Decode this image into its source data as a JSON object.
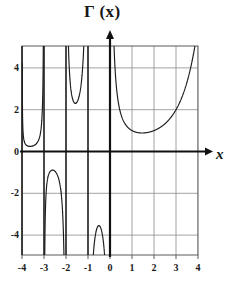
{
  "figure": {
    "kind": "function-plot",
    "background_color": "#ffffff",
    "y_axis_title": "Γ (x)",
    "x_axis_title": "x"
  },
  "chart_data": {
    "type": "line",
    "title": "Γ (x)",
    "function": "gamma",
    "xlabel": "x",
    "ylabel": "Γ (x)",
    "xlim": [
      -4,
      4
    ],
    "ylim": [
      -5,
      5
    ],
    "grid": true,
    "grid_color": "#8c8c8c",
    "curve_color": "#1a1a1a",
    "axis_color": "#111111",
    "frame_color": "#5a5a5a",
    "legend": "none",
    "x_ticks": [
      -4,
      -3,
      -2,
      -1,
      0,
      1,
      2,
      3,
      4
    ],
    "x_tick_labels": [
      "-4",
      "-3",
      "-2",
      "-1",
      "0",
      "1",
      "2",
      "3",
      "4"
    ],
    "y_ticks": [
      4,
      2,
      0,
      -2,
      -4
    ],
    "y_tick_labels": [
      "4",
      "2",
      "0",
      "-2",
      "-4"
    ],
    "poles": [
      -4,
      -3,
      -2,
      -1,
      0
    ],
    "branches": [
      {
        "name": "branch--4--3",
        "x_start": -3.99,
        "x_end": -3.01,
        "sign": "positive",
        "minimum": {
          "x": -3.48,
          "y": 0.5
        }
      },
      {
        "name": "branch--3--2",
        "x_start": -2.99,
        "x_end": -2.01,
        "sign": "negative",
        "maximum": {
          "x": -2.46,
          "y": -0.9
        }
      },
      {
        "name": "branch--2--1",
        "x_start": -1.99,
        "x_end": -1.01,
        "sign": "positive",
        "minimum": {
          "x": -1.57,
          "y": 2.3
        }
      },
      {
        "name": "branch--1-0",
        "x_start": -0.99,
        "x_end": -0.01,
        "sign": "negative",
        "maximum": {
          "x": -0.5,
          "y": -3.54
        }
      },
      {
        "name": "branch-0-4",
        "x_start": 0.01,
        "x_end": 4.0,
        "sign": "positive",
        "minimum": {
          "x": 1.46,
          "y": 0.886
        }
      }
    ],
    "annotations": []
  },
  "geometry": {
    "width": 237,
    "height": 283,
    "plot_left": 22,
    "plot_right": 198,
    "plot_top": 46,
    "plot_bottom": 255,
    "x_origin": 110,
    "y_origin": 151.5,
    "px_per_x_unit": 22,
    "px_per_y_unit": 20.9,
    "y_arrow_tip": 30,
    "x_arrow_tip": 213
  }
}
